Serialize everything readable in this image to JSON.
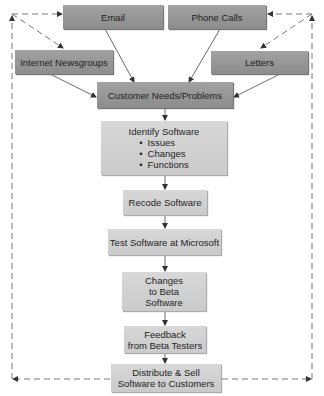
{
  "diagram": {
    "sources": {
      "email": "Email",
      "phone": "Phone Calls",
      "newsgroups": "Internet Newsgroups",
      "letters": "Letters"
    },
    "needs": "Customer Needs/Problems",
    "identify": {
      "title": "Identify Software",
      "items": [
        "Issues",
        "Changes",
        "Functions"
      ]
    },
    "recode": "Recode Software",
    "test": "Test Software at Microsoft",
    "changes": [
      "Changes",
      "to Beta",
      "Software"
    ],
    "feedback": [
      "Feedback",
      "from Beta Testers"
    ],
    "distribute": [
      "Distribute & Sell",
      "Software to Customers"
    ]
  }
}
